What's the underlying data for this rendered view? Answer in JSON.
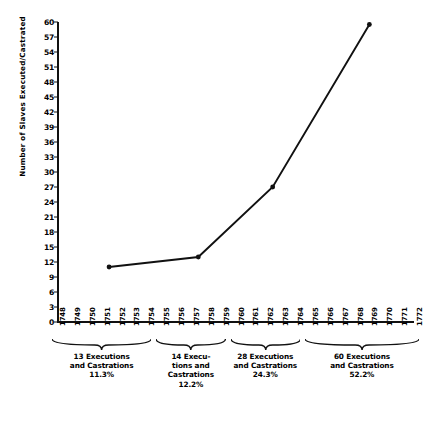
{
  "chart_data": {
    "type": "line",
    "title": "",
    "xlabel": "",
    "ylabel": "Number of Slaves Executed/Castrated",
    "ylim": [
      0,
      60
    ],
    "ytick_step": 3,
    "grid": false,
    "legend": "none",
    "yticks": [
      60,
      57,
      54,
      51,
      48,
      45,
      42,
      39,
      36,
      33,
      30,
      27,
      24,
      21,
      18,
      15,
      12,
      9,
      6,
      3,
      0
    ],
    "x": [
      1748,
      1749,
      1750,
      1751,
      1752,
      1753,
      1754,
      1755,
      1756,
      1757,
      1758,
      1759,
      1760,
      1761,
      1762,
      1763,
      1764,
      1765,
      1766,
      1767,
      1768,
      1769,
      1770,
      1771,
      1772
    ],
    "xticklabels": [
      "1748",
      "1749",
      "1750",
      "1751",
      "1752",
      "1753",
      "1754",
      "1755",
      "1756",
      "1757",
      "1758",
      "1759",
      "1760",
      "1761",
      "1762",
      "1763",
      "1764",
      "1765",
      "1766",
      "1767",
      "1768",
      "1769",
      "1770",
      "1771",
      "1772"
    ],
    "series": [
      {
        "name": "Slaves Executed/Castrated",
        "points": [
          {
            "x": 1751.5,
            "y": 11
          },
          {
            "x": 1757.5,
            "y": 13
          },
          {
            "x": 1762.5,
            "y": 27
          },
          {
            "x": 1769.0,
            "y": 59.5
          }
        ]
      }
    ],
    "period_groups": [
      {
        "label_count": "13 Executions",
        "label_and": "and Castrations",
        "label_pct": "11.3%",
        "count": 13,
        "percent": 11.3,
        "years": [
          "1748",
          "1754"
        ]
      },
      {
        "label_count": "14 Execu-",
        "label_and": "tions and",
        "label_and2": "Castrations",
        "label_pct": "12.2%",
        "count": 14,
        "percent": 12.2,
        "years": [
          "1755",
          "1759"
        ]
      },
      {
        "label_count": "28 Executions",
        "label_and": "and Castrations",
        "label_pct": "24.3%",
        "count": 28,
        "percent": 24.3,
        "years": [
          "1760",
          "1764"
        ]
      },
      {
        "label_count": "60 Executions",
        "label_and": "and Castrations",
        "label_pct": "52.2%",
        "count": 60,
        "percent": 52.2,
        "years": [
          "1765",
          "1772"
        ]
      }
    ],
    "colors": {
      "line": "#111111",
      "marker": "#111111",
      "axis": "#111111",
      "background": "#ffffff"
    }
  }
}
